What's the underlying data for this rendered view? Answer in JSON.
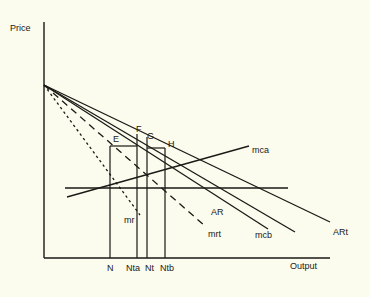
{
  "figure": {
    "background_color": "#fbfbee",
    "line_color": "#1a1a16",
    "axis": {
      "y_label": "Price",
      "x_label": "Output",
      "origin_x": 44,
      "origin_y": 258,
      "y_top": 22,
      "x_right": 330
    }
  },
  "chart_data": {
    "type": "line",
    "title": "",
    "xlabel": "Output",
    "ylabel": "Price",
    "grid": false,
    "legend": "inline-right",
    "xlim": [
      0,
      330
    ],
    "ylim": [
      0,
      258
    ],
    "apex": {
      "x": 44,
      "y": 85
    },
    "series": [
      {
        "name": "ARt",
        "label": "ARt",
        "style": "solid",
        "points": [
          [
            44,
            85
          ],
          [
            330,
            222
          ]
        ],
        "label_x": 333,
        "label_y": 228
      },
      {
        "name": "AR",
        "label": "AR",
        "style": "solid",
        "points": [
          [
            44,
            85
          ],
          [
            295,
            232
          ]
        ],
        "label_x": 211,
        "label_y": 208
      },
      {
        "name": "mcb",
        "label": "mcb",
        "style": "solid",
        "points": [
          [
            44,
            85
          ],
          [
            268,
            229
          ]
        ],
        "label_x": 255,
        "label_y": 231
      },
      {
        "name": "mrt",
        "label": "mrt",
        "style": "dashed",
        "points": [
          [
            44,
            85
          ],
          [
            205,
            226
          ]
        ],
        "label_x": 208,
        "label_y": 230
      },
      {
        "name": "mr",
        "label": "mr",
        "style": "dotted",
        "points": [
          [
            44,
            85
          ],
          [
            140,
            215
          ]
        ],
        "label_x": 124,
        "label_y": 216
      },
      {
        "name": "mca",
        "label": "mca",
        "style": "solid",
        "points": [
          [
            67,
            197
          ],
          [
            249,
            146
          ]
        ],
        "label_x": 252,
        "label_y": 146
      },
      {
        "name": "mc-horizontal",
        "label": "",
        "style": "solid",
        "points": [
          [
            65,
            188
          ],
          [
            288,
            188
          ]
        ],
        "label_x": 0,
        "label_y": 0
      }
    ],
    "vertical_lines": [
      {
        "name": "N",
        "x": 110,
        "y_top": 146,
        "y_bottom": 258
      },
      {
        "name": "Nta",
        "x": 137,
        "y_top": 134,
        "y_bottom": 258
      },
      {
        "name": "Nt",
        "x": 147,
        "y_top": 137,
        "y_bottom": 258
      },
      {
        "name": "Ntb",
        "x": 165,
        "y_top": 148,
        "y_bottom": 258
      }
    ],
    "horizontal_segments": [
      {
        "name": "E-F",
        "x1": 110,
        "x2": 137,
        "y": 146
      },
      {
        "name": "G-H",
        "x1": 147,
        "x2": 165,
        "y": 148
      }
    ],
    "point_labels": [
      {
        "name": "E",
        "label": "E",
        "x": 113,
        "y": 135
      },
      {
        "name": "F",
        "label": "F",
        "x": 136,
        "y": 125
      },
      {
        "name": "G",
        "label": "G",
        "x": 147,
        "y": 132
      },
      {
        "name": "H",
        "label": "H",
        "x": 168,
        "y": 140
      }
    ],
    "x_tick_labels": [
      {
        "name": "N",
        "label": "N",
        "x": 107,
        "y": 264
      },
      {
        "name": "Nta",
        "label": "Nta",
        "x": 126,
        "y": 264
      },
      {
        "name": "Nt",
        "label": "Nt",
        "x": 145,
        "y": 264
      },
      {
        "name": "Ntb",
        "label": "Ntb",
        "x": 160,
        "y": 264
      }
    ],
    "axis_labels": [
      {
        "name": "price",
        "label": "Price",
        "x": 10,
        "y": 24
      },
      {
        "name": "output",
        "label": "Output",
        "x": 290,
        "y": 262
      }
    ]
  }
}
